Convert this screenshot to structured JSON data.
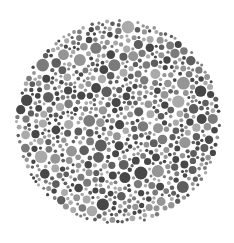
{
  "image": {
    "description": "Grayscale dot-pattern test plate (Ishihara-style), no legible figure",
    "background": "#ffffff",
    "plate": {
      "cx": 118,
      "cy": 122,
      "r": 103
    },
    "dot_colors": [
      "#474747",
      "#5e5e5e",
      "#7b7b7b",
      "#959595",
      "#aaaaaa"
    ],
    "dot_radius_range": [
      1.5,
      6.5
    ],
    "seed": 7
  }
}
